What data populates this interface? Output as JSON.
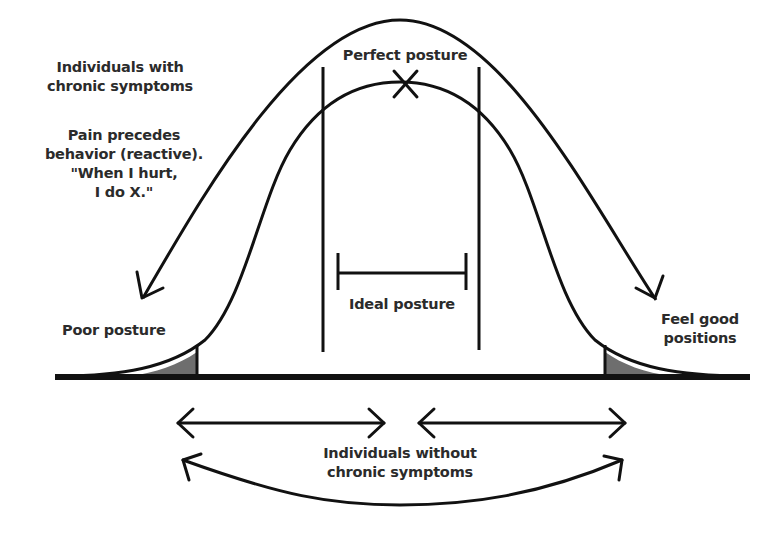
{
  "diagram": {
    "colors": {
      "stroke": "#111111",
      "shade": "#6e6e6e",
      "text": "#2b2b2b",
      "background": "#ffffff"
    },
    "labels": {
      "chronic_group": {
        "line1": "Individuals with",
        "line2": "chronic symptoms"
      },
      "reactive_note": {
        "line1": "Pain precedes",
        "line2": "behavior (reactive).",
        "line3": "\"When I hurt,",
        "line4": "I do X.\""
      },
      "perfect_posture": "Perfect posture",
      "ideal_posture": "Ideal posture",
      "poor_posture": "Poor posture",
      "feel_good": {
        "line1": "Feel good",
        "line2": "positions"
      },
      "non_chronic_group": {
        "line1": "Individuals without",
        "line2": "chronic symptoms"
      }
    },
    "markers": {
      "perfect_marker": "X",
      "ideal_range": "bracket",
      "shaded_tails": [
        "left-tail",
        "right-tail"
      ]
    }
  }
}
